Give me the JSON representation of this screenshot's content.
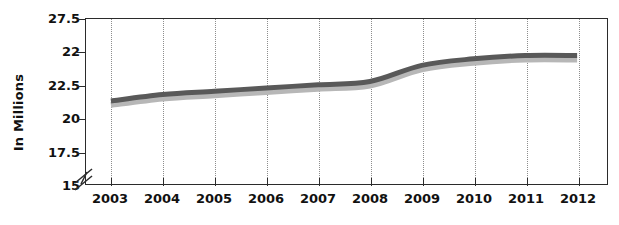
{
  "chart_data": {
    "type": "line",
    "title": "",
    "xlabel": "",
    "ylabel": "In Millions",
    "categories": [
      "2003",
      "2004",
      "2005",
      "2006",
      "2007",
      "2008",
      "2009",
      "2010",
      "2011",
      "2012"
    ],
    "values": [
      20.9,
      21.0,
      21.05,
      21.1,
      21.15,
      21.2,
      21.45,
      21.55,
      21.6,
      21.6
    ],
    "y_tick_labels": [
      "27.5",
      "22",
      "22.5",
      "20",
      "17.5",
      "15"
    ],
    "axis_break": true,
    "grid": "vertical-dotted",
    "legend": "none",
    "series": [
      {
        "name": "series-1",
        "values": [
          20.9,
          21.0,
          21.05,
          21.1,
          21.15,
          21.2,
          21.45,
          21.55,
          21.6,
          21.6
        ]
      }
    ],
    "line_color": "#595959",
    "shadow_color": "#b7b7b7",
    "axis_color": "#2b2b2b",
    "gridline_color": "#8d8d8d"
  }
}
